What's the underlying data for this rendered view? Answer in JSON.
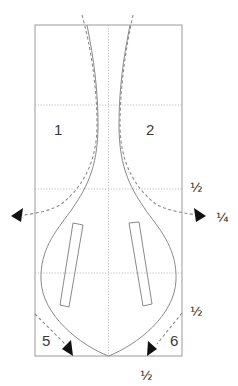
{
  "diagram": {
    "type": "pattern-folding-diagram",
    "panel_labels": [
      "1",
      "2",
      "5",
      "6"
    ],
    "fraction_labels": {
      "right_upper": "½",
      "right_arrow": "¼",
      "right_lower": "½",
      "bottom": "½"
    },
    "colors": {
      "outline": "#8a8a8a",
      "fold_line": "#8a8a8a",
      "grid": "#b0b0b0",
      "arrow": "#111111"
    },
    "arrows": [
      {
        "name": "left-fold-arrow",
        "direction": "left"
      },
      {
        "name": "right-fold-arrow",
        "direction": "right"
      },
      {
        "name": "bottom-left-fold-arrow",
        "direction": "down-right"
      },
      {
        "name": "bottom-right-fold-arrow",
        "direction": "down-left"
      }
    ]
  }
}
